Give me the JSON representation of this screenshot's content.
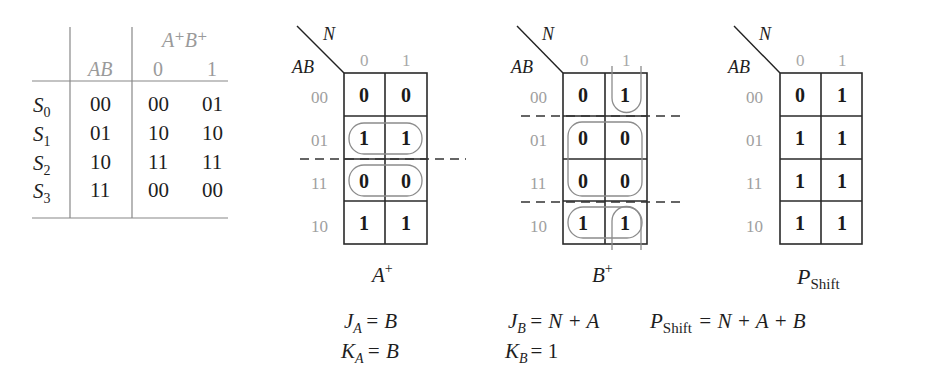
{
  "state_table": {
    "header": {
      "group_label": "A⁺B⁺",
      "present_state_label": "AB",
      "input_columns": [
        "0",
        "1"
      ]
    },
    "rows": [
      {
        "state": "S",
        "sub": "0",
        "ab": "00",
        "n0": "00",
        "n1": "01"
      },
      {
        "state": "S",
        "sub": "1",
        "ab": "01",
        "n0": "10",
        "n1": "10"
      },
      {
        "state": "S",
        "sub": "2",
        "ab": "10",
        "n0": "11",
        "n1": "11"
      },
      {
        "state": "S",
        "sub": "3",
        "ab": "11",
        "n0": "00",
        "n1": "00"
      }
    ]
  },
  "kmaps": [
    {
      "id": "A_plus",
      "corner_col_var": "N",
      "corner_row_var": "AB",
      "col_labels": [
        "0",
        "1"
      ],
      "row_labels": [
        "00",
        "01",
        "11",
        "10"
      ],
      "cells": [
        [
          "0",
          "0"
        ],
        [
          "1",
          "1"
        ],
        [
          "0",
          "0"
        ],
        [
          "1",
          "1"
        ]
      ],
      "title": "A",
      "title_sup": "+",
      "equations": [
        {
          "lhs": "J",
          "sub": "A",
          "rhs": "= B"
        },
        {
          "lhs": "K",
          "sub": "A",
          "rhs": "= B"
        }
      ]
    },
    {
      "id": "B_plus",
      "corner_col_var": "N",
      "corner_row_var": "AB",
      "col_labels": [
        "0",
        "1"
      ],
      "row_labels": [
        "00",
        "01",
        "11",
        "10"
      ],
      "cells": [
        [
          "0",
          "1"
        ],
        [
          "0",
          "0"
        ],
        [
          "0",
          "0"
        ],
        [
          "1",
          "1"
        ]
      ],
      "title": "B",
      "title_sup": "+",
      "equations": [
        {
          "lhs": "J",
          "sub": "B",
          "rhs": "= N + A"
        },
        {
          "lhs": "K",
          "sub": "B",
          "rhs": "= 1"
        }
      ]
    },
    {
      "id": "P_shift",
      "corner_col_var": "N",
      "corner_row_var": "AB",
      "col_labels": [
        "0",
        "1"
      ],
      "row_labels": [
        "00",
        "01",
        "11",
        "10"
      ],
      "cells": [
        [
          "0",
          "1"
        ],
        [
          "1",
          "1"
        ],
        [
          "1",
          "1"
        ],
        [
          "1",
          "1"
        ]
      ],
      "title": "P",
      "title_sub": "Shift",
      "equations": [
        {
          "lhs": "P",
          "sub": "Shift",
          "rhs": "= N + A + B"
        }
      ]
    }
  ]
}
